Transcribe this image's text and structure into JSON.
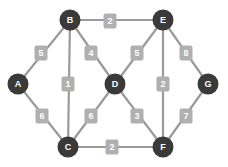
{
  "graph": {
    "title": "Weighted Undirected Graph",
    "node_color": "#3a3a3a",
    "edge_color": "#9a9a9a",
    "label_color": "#b0b0b0",
    "label_text_color": "#ffffff",
    "background": "#ffffff",
    "node_radius": 10.5,
    "nodes": [
      {
        "id": "A",
        "label": "A",
        "x": 18,
        "y": 84
      },
      {
        "id": "B",
        "label": "B",
        "x": 70,
        "y": 20
      },
      {
        "id": "C",
        "label": "C",
        "x": 68,
        "y": 147
      },
      {
        "id": "D",
        "label": "D",
        "x": 115,
        "y": 84
      },
      {
        "id": "E",
        "label": "E",
        "x": 163,
        "y": 20
      },
      {
        "id": "F",
        "label": "F",
        "x": 163,
        "y": 147
      },
      {
        "id": "G",
        "label": "G",
        "x": 208,
        "y": 84
      }
    ],
    "edges": [
      {
        "from": "A",
        "to": "B",
        "weight": "5",
        "x1": 18,
        "y1": 84,
        "x2": 70,
        "y2": 20,
        "lx": 41,
        "ly": 53
      },
      {
        "from": "A",
        "to": "C",
        "weight": "6",
        "x1": 18,
        "y1": 84,
        "x2": 68,
        "y2": 147,
        "lx": 42,
        "ly": 116
      },
      {
        "from": "B",
        "to": "E",
        "weight": "2",
        "x1": 70,
        "y1": 20,
        "x2": 163,
        "y2": 20,
        "lx": 110,
        "ly": 21
      },
      {
        "from": "B",
        "to": "C",
        "weight": "1",
        "x1": 70,
        "y1": 20,
        "x2": 68,
        "y2": 147,
        "lx": 68,
        "ly": 84
      },
      {
        "from": "B",
        "to": "D",
        "weight": "4",
        "x1": 70,
        "y1": 20,
        "x2": 115,
        "y2": 84,
        "lx": 91,
        "ly": 53
      },
      {
        "from": "C",
        "to": "D",
        "weight": "6",
        "x1": 68,
        "y1": 147,
        "x2": 115,
        "y2": 84,
        "lx": 91,
        "ly": 116
      },
      {
        "from": "C",
        "to": "F",
        "weight": "2",
        "x1": 68,
        "y1": 147,
        "x2": 163,
        "y2": 147,
        "lx": 112,
        "ly": 147
      },
      {
        "from": "D",
        "to": "E",
        "weight": "5",
        "x1": 115,
        "y1": 84,
        "x2": 163,
        "y2": 20,
        "lx": 137,
        "ly": 53
      },
      {
        "from": "D",
        "to": "F",
        "weight": "3",
        "x1": 115,
        "y1": 84,
        "x2": 163,
        "y2": 147,
        "lx": 137,
        "ly": 116
      },
      {
        "from": "E",
        "to": "F",
        "weight": "2",
        "x1": 163,
        "y1": 20,
        "x2": 163,
        "y2": 147,
        "lx": 163,
        "ly": 84
      },
      {
        "from": "E",
        "to": "G",
        "weight": "8",
        "x1": 163,
        "y1": 20,
        "x2": 208,
        "y2": 84,
        "lx": 186,
        "ly": 53
      },
      {
        "from": "F",
        "to": "G",
        "weight": "7",
        "x1": 163,
        "y1": 147,
        "x2": 208,
        "y2": 84,
        "lx": 186,
        "ly": 116
      }
    ]
  }
}
